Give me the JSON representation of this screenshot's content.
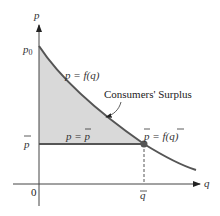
{
  "diagram": {
    "title": "Consumers' Surplus",
    "axes": {
      "y_label": "p",
      "x_label": "q",
      "origin_label": "0"
    },
    "ticks": {
      "p0": "p",
      "p0_sub": "0",
      "pbar": "p",
      "qbar": "q"
    },
    "curve_label": "p = f(q)",
    "horizontal_line_label": "p = p",
    "point_label": "p = f(q)",
    "region_label": "Consumers' Surplus",
    "colors": {
      "curve": "#555555",
      "line": "#555555",
      "fill": "#d9d9d9",
      "axis": "#444444",
      "point": "#555555"
    }
  }
}
